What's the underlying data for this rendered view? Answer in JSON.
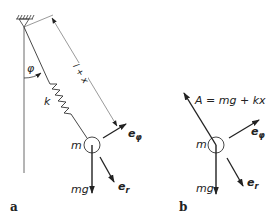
{
  "figure_a": {
    "label": "a",
    "angle_label": "φ",
    "spring_label": "k",
    "length_label": "l + x",
    "mass_label": "m",
    "weight_label": "mg",
    "unit_vectors": {
      "radial": {
        "base": "e",
        "sub": "r"
      },
      "tangential": {
        "base": "e",
        "sub": "φ"
      }
    }
  },
  "figure_b": {
    "label": "b",
    "force_label": "A = mg + kx",
    "mass_label": "m",
    "weight_label": "mg",
    "unit_vectors": {
      "radial": {
        "base": "e",
        "sub": "r"
      },
      "tangential": {
        "base": "e",
        "sub": "φ"
      }
    }
  },
  "colors": {
    "stroke": "#222222",
    "thin_stroke": "#555555",
    "background": "#ffffff"
  }
}
